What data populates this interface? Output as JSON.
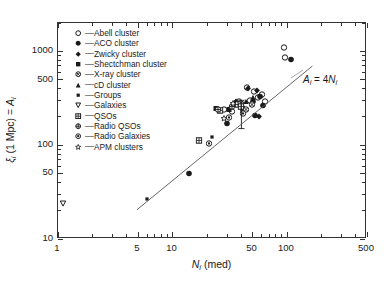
{
  "chart_data": {
    "type": "scatter",
    "title": "",
    "xlabel": "N_i (med)",
    "ylabel": "xi_i (1 Mpc) = A_i",
    "xscale": "log",
    "yscale": "log",
    "xlim": [
      1,
      500
    ],
    "ylim": [
      10,
      2000
    ],
    "grid": false,
    "legend_position": "upper-left-inside",
    "xticks": [
      1,
      5,
      10,
      50,
      100,
      500
    ],
    "xtick_labels": [
      "1",
      "5",
      "10",
      "50",
      "100",
      "500"
    ],
    "yticks": [
      10,
      50,
      100,
      500,
      1000
    ],
    "ytick_labels": [
      "10",
      "50",
      "100",
      "500",
      "1000"
    ],
    "annotations": [
      {
        "text": "A_i = 4N_i",
        "x": 150,
        "y": 330,
        "kind": "fit-line-label"
      }
    ],
    "fit_line": {
      "label": "A_i = 4N_i",
      "relation": "A = 4 * N",
      "x_start": 5.0,
      "y_start": 20.0,
      "x_end": 170.0,
      "y_end": 680.0
    },
    "series": [
      {
        "name": "Abell cluster",
        "marker": "open-circle",
        "points": [
          [
            95,
            1150
          ],
          [
            97,
            880
          ],
          [
            45,
            430
          ],
          [
            52,
            390
          ],
          [
            60,
            360
          ],
          [
            38,
            300
          ],
          [
            33,
            235
          ],
          [
            56,
            330
          ],
          [
            48,
            310
          ],
          [
            64,
            300
          ],
          [
            28,
            250
          ]
        ]
      },
      {
        "name": "ACO cluster",
        "marker": "filled-circle",
        "points": [
          [
            108,
            850
          ],
          [
            58,
            340
          ],
          [
            50,
            300
          ],
          [
            62,
            275
          ],
          [
            41,
            245
          ],
          [
            14,
            52
          ],
          [
            30,
            175
          ],
          [
            53,
            215
          ]
        ]
      },
      {
        "name": "Zwicky cluster",
        "marker": "filled-diamond",
        "points": [
          [
            46,
            420
          ],
          [
            55,
            400
          ],
          [
            42,
            255
          ],
          [
            57,
            210
          ],
          [
            36,
            300
          ]
        ]
      },
      {
        "name": "Shectchman cluster",
        "marker": "filled-square",
        "points": [
          [
            24,
            255
          ],
          [
            31,
            248
          ]
        ]
      },
      {
        "name": "X-ray cluster",
        "marker": "circle-x",
        "points": [
          [
            40,
            290
          ],
          [
            49,
            280
          ],
          [
            44,
            250
          ]
        ]
      },
      {
        "name": "cD cluster",
        "marker": "filled-triangle-up",
        "points": [
          [
            50,
            330
          ],
          [
            44,
            300
          ]
        ]
      },
      {
        "name": "Groups",
        "marker": "small-square",
        "points": [
          [
            6,
            28
          ],
          [
            22,
            128
          ]
        ]
      },
      {
        "name": "Galaxies",
        "marker": "open-triangle-down",
        "points": [
          [
            1.1,
            25
          ]
        ]
      },
      {
        "name": "QSOs",
        "marker": "grid-square",
        "points": [
          [
            17,
            115
          ],
          [
            37,
            280
          ],
          [
            26,
            245
          ],
          [
            40,
            265
          ]
        ]
      },
      {
        "name": "Radio QSOs",
        "marker": "circle-cross",
        "points": [
          [
            25,
            250
          ],
          [
            33,
            270
          ]
        ]
      },
      {
        "name": "Radio Galaxies",
        "marker": "circle-dot",
        "points": [
          [
            21,
            108
          ],
          [
            31,
            205
          ],
          [
            41,
            225
          ]
        ]
      },
      {
        "name": "APM clusters",
        "marker": "open-star",
        "points": [
          [
            28,
            200
          ],
          [
            34,
            290
          ]
        ]
      }
    ],
    "error_bars": [
      {
        "x": 40,
        "y": 200,
        "y_low": 150,
        "y_high": 300,
        "marker": "filled-circle"
      }
    ]
  },
  "axes": {
    "y_label_parts": {
      "sym": "ξ",
      "sub1": "i",
      "mid": " (1 Mpc) = ",
      "sym2": "A",
      "sub2": "i"
    },
    "x_label_parts": {
      "sym": "N",
      "sub": "i",
      "tail": " (med)"
    },
    "annotation_parts": {
      "a": "A",
      "asub": "i",
      "eq": " = 4",
      "n": "N",
      "nsub": "i"
    }
  },
  "legend": {
    "dash": "—",
    "items": [
      {
        "label": "Abell cluster",
        "marker": "open-circle"
      },
      {
        "label": "ACO cluster",
        "marker": "filled-circle"
      },
      {
        "label": "Zwicky cluster",
        "marker": "filled-diamond"
      },
      {
        "label": "Shectchman cluster",
        "marker": "filled-square"
      },
      {
        "label": "X-ray cluster",
        "marker": "circle-x"
      },
      {
        "label": "cD cluster",
        "marker": "filled-triangle-up"
      },
      {
        "label": "Groups",
        "marker": "small-square"
      },
      {
        "label": "Galaxies",
        "marker": "open-triangle-down"
      },
      {
        "label": "QSOs",
        "marker": "grid-square"
      },
      {
        "label": "Radio QSOs",
        "marker": "circle-cross"
      },
      {
        "label": "Radio Galaxies",
        "marker": "circle-dot"
      },
      {
        "label": "APM clusters",
        "marker": "open-star"
      }
    ]
  },
  "colors": {
    "ink": "#1a1a1a",
    "axis": "#333333",
    "background": "#ffffff",
    "fit_line": "#555555"
  }
}
